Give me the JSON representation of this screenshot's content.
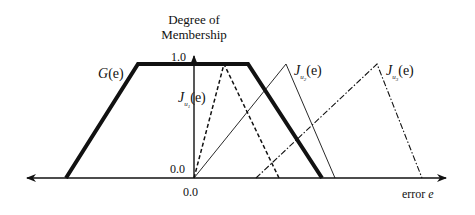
{
  "diagram": {
    "type": "fuzzy-membership-functions",
    "y_axis_title_line1": "Degree of",
    "y_axis_title_line2": "Membership",
    "y_tick_top": "1.0",
    "y_tick_origin": "0.0",
    "x_tick_origin": "0.0",
    "x_axis_label": "error e",
    "x_axis_label_word": "error",
    "x_axis_label_var": "e",
    "colors": {
      "line": "#111111",
      "background": "#ffffff"
    },
    "functions": [
      {
        "id": "G",
        "label_symbol": "G",
        "label_arg": "(e)",
        "shape": "trapezoid",
        "style": "thick-solid",
        "points": [
          [
            66,
            178
          ],
          [
            138,
            64
          ],
          [
            248,
            64
          ],
          [
            322,
            178
          ]
        ]
      },
      {
        "id": "Ju1",
        "label_symbol": "J",
        "label_sub": "u1",
        "label_arg": "(e)",
        "shape": "triangle",
        "style": "dashed",
        "points": [
          [
            194,
            178
          ],
          [
            224,
            64
          ],
          [
            279,
            178
          ]
        ]
      },
      {
        "id": "Ju2",
        "label_symbol": "J",
        "label_sub": "u2",
        "label_arg": "(e)",
        "shape": "triangle",
        "style": "thin-solid",
        "points": [
          [
            194,
            178
          ],
          [
            286,
            64
          ],
          [
            335,
            178
          ]
        ]
      },
      {
        "id": "Ju3",
        "label_symbol": "J",
        "label_sub": "u3",
        "label_arg": "(e)",
        "shape": "triangle",
        "style": "dash-dot",
        "points": [
          [
            256,
            178
          ],
          [
            377,
            64
          ],
          [
            422,
            178
          ]
        ]
      }
    ]
  }
}
